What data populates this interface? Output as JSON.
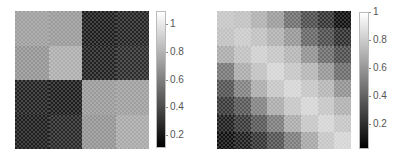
{
  "chart_data": [
    {
      "type": "heatmap",
      "title": "",
      "xlabel": "",
      "ylabel": "",
      "grid": false,
      "rows": 4,
      "cols": 4,
      "values": [
        [
          0.72,
          0.7,
          0.22,
          0.25
        ],
        [
          0.68,
          0.78,
          0.24,
          0.28
        ],
        [
          0.24,
          0.22,
          0.7,
          0.72
        ],
        [
          0.22,
          0.26,
          0.68,
          0.76
        ]
      ],
      "colormap": "gray",
      "colorbar": {
        "range": [
          0.11,
          1.09
        ],
        "ticks": [
          "0.2",
          "0.4",
          "0.6",
          "0.8",
          "1"
        ],
        "tick_values": [
          0.2,
          0.4,
          0.6,
          0.8,
          1.0
        ]
      }
    },
    {
      "type": "heatmap",
      "title": "",
      "xlabel": "",
      "ylabel": "",
      "grid": false,
      "rows": 8,
      "cols": 8,
      "values": [
        [
          0.78,
          0.76,
          0.7,
          0.62,
          0.45,
          0.32,
          0.22,
          0.08
        ],
        [
          0.76,
          0.8,
          0.76,
          0.7,
          0.6,
          0.42,
          0.32,
          0.2
        ],
        [
          0.68,
          0.76,
          0.82,
          0.78,
          0.72,
          0.58,
          0.44,
          0.32
        ],
        [
          0.48,
          0.68,
          0.76,
          0.84,
          0.78,
          0.72,
          0.6,
          0.44
        ],
        [
          0.34,
          0.52,
          0.68,
          0.78,
          0.84,
          0.78,
          0.72,
          0.58
        ],
        [
          0.24,
          0.36,
          0.52,
          0.68,
          0.78,
          0.84,
          0.78,
          0.7
        ],
        [
          0.14,
          0.24,
          0.36,
          0.5,
          0.68,
          0.78,
          0.84,
          0.78
        ],
        [
          0.08,
          0.14,
          0.22,
          0.34,
          0.5,
          0.66,
          0.78,
          0.84
        ]
      ],
      "colormap": "gray",
      "colorbar": {
        "range": [
          0.02,
          1.0
        ],
        "ticks": [
          "0.2",
          "0.4",
          "0.6",
          "0.8",
          "1"
        ],
        "tick_values": [
          0.2,
          0.4,
          0.6,
          0.8,
          1.0
        ]
      }
    }
  ],
  "layout": {
    "charts": [
      {
        "map": {
          "x": 15,
          "y": 11,
          "w": 134,
          "h": 138
        },
        "cbar": {
          "x": 156,
          "y": 11,
          "w": 10,
          "h": 137
        }
      },
      {
        "map": {
          "x": 217,
          "y": 11,
          "w": 134,
          "h": 138
        },
        "cbar": {
          "x": 359,
          "y": 12,
          "w": 10,
          "h": 137
        }
      }
    ]
  }
}
